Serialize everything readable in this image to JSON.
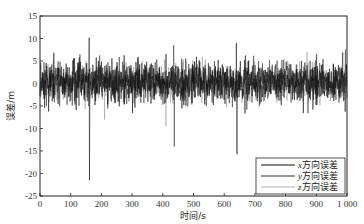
{
  "chart_data": {
    "type": "line",
    "title": "",
    "xlabel": "时间/s",
    "ylabel": "误差/m",
    "xlim": [
      0,
      1000
    ],
    "ylim": [
      -25,
      15
    ],
    "xticks": [
      0,
      100,
      200,
      300,
      400,
      500,
      600,
      700,
      800,
      900,
      1000
    ],
    "xtick_labels": [
      "0",
      "100",
      "200",
      "300",
      "400",
      "500",
      "600",
      "700",
      "800",
      "900",
      "1 000"
    ],
    "yticks": [
      15,
      10,
      5,
      0,
      -5,
      -10,
      -15,
      -20,
      -25
    ],
    "ytick_labels": [
      "15",
      "10",
      "5",
      "0",
      "-5",
      "-10",
      "-15",
      "-20",
      "-25"
    ],
    "grid": false,
    "legend_position": "lower right",
    "noise_description": "dense random error signals, typical band about -6 to +7 m around 0",
    "n_points": 1000,
    "series": [
      {
        "name": "x方向误差",
        "name_var": "x",
        "name_suffix": "方向误差",
        "color": "#111111",
        "width": 1.0,
        "amplitude": 3.0,
        "seed": 11,
        "spikes": [
          {
            "t": 160,
            "value": 10.2
          },
          {
            "t": 161,
            "value": -21.5
          },
          {
            "t": 640,
            "value": 9.0
          },
          {
            "t": 642,
            "value": -15.7
          }
        ]
      },
      {
        "name": "y方向误差",
        "name_var": "y",
        "name_suffix": "方向误差",
        "color": "#333333",
        "width": 1.0,
        "amplitude": 2.8,
        "seed": 23,
        "spikes": [
          {
            "t": 437,
            "value": -14.0
          },
          {
            "t": 435,
            "value": 8.5
          },
          {
            "t": 995,
            "value": 7.5
          }
        ]
      },
      {
        "name": "z方向误差",
        "name_var": "z",
        "name_suffix": "方向误差",
        "color": "#888888",
        "width": 0.8,
        "amplitude": 2.6,
        "seed": 37,
        "spikes": [
          {
            "t": 410,
            "value": -9.5
          },
          {
            "t": 210,
            "value": -8.0
          },
          {
            "t": 870,
            "value": 7.0
          }
        ]
      }
    ]
  },
  "axes": {
    "xlabel": "时间/s",
    "ylabel": "误差/m"
  },
  "legend": {
    "items": [
      {
        "var": "x",
        "label": "方向误差"
      },
      {
        "var": "y",
        "label": "方向误差"
      },
      {
        "var": "z",
        "label": "方向误差"
      }
    ]
  }
}
